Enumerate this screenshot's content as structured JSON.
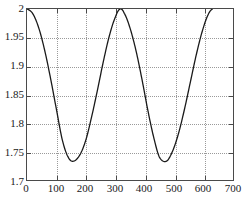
{
  "chart_data": {
    "type": "line",
    "title": "",
    "xlabel": "",
    "ylabel": "",
    "xlim": [
      0,
      700
    ],
    "ylim": [
      1.7,
      2.0
    ],
    "grid": true,
    "legend": null,
    "x_ticks": [
      "0",
      "100",
      "200",
      "300",
      "400",
      "500",
      "600",
      "700"
    ],
    "x_tick_values": [
      0,
      100,
      200,
      300,
      400,
      500,
      600,
      700
    ],
    "y_ticks": [
      "2",
      "1.95",
      "1.9",
      "1.85",
      "1.8",
      "1.75",
      "1.7"
    ],
    "y_tick_values": [
      2,
      1.95,
      1.9,
      1.85,
      1.8,
      1.75,
      1.7
    ],
    "line_color": "#1a1a1a",
    "grid_color": "#9a9a9a",
    "axis_color": "#4a4a4a",
    "series": [
      {
        "name": "curve",
        "description": "cosine-like oscillation, period ~316, amplitude ~0.1335 about 1.8665",
        "x": [
          0,
          20,
          40,
          60,
          80,
          100,
          120,
          140,
          158,
          180,
          200,
          220,
          240,
          260,
          280,
          300,
          316,
          330,
          350,
          370,
          390,
          410,
          430,
          450,
          474,
          495,
          515,
          535,
          555,
          575,
          595,
          615,
          630
        ],
        "y": [
          2.0,
          1.9915,
          1.9667,
          1.9277,
          1.8784,
          1.8239,
          1.7703,
          1.74,
          1.733,
          1.7443,
          1.7703,
          1.8117,
          1.8592,
          1.9092,
          1.9533,
          1.9854,
          2.0,
          1.993,
          1.9667,
          1.9277,
          1.8784,
          1.8239,
          1.776,
          1.74,
          1.733,
          1.7509,
          1.782,
          1.8239,
          1.8715,
          1.9192,
          1.96,
          1.9893,
          2.0
        ]
      }
    ],
    "annotations": []
  }
}
